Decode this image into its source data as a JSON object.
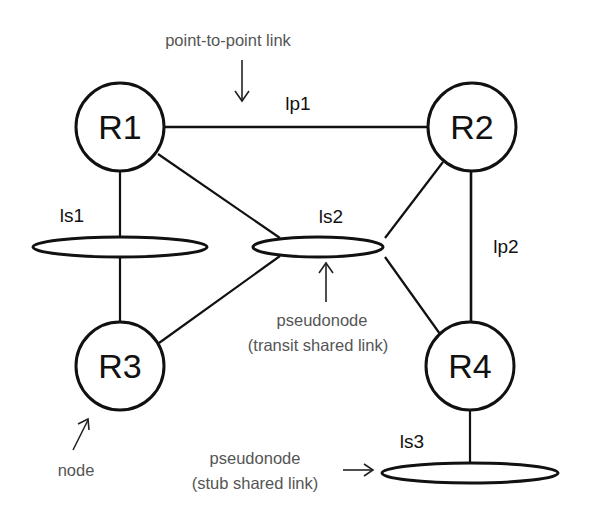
{
  "diagram": {
    "nodes": [
      {
        "id": "R1",
        "label": "R1"
      },
      {
        "id": "R2",
        "label": "R2"
      },
      {
        "id": "R3",
        "label": "R3"
      },
      {
        "id": "R4",
        "label": "R4"
      }
    ],
    "links": {
      "lp1": "lp1",
      "lp2": "lp2",
      "ls1": "ls1",
      "ls2": "ls2",
      "ls3": "ls3"
    },
    "annotations": {
      "point_to_point": "point-to-point link",
      "transit_line1": "pseudonode",
      "transit_line2": "(transit shared link)",
      "stub_line1": "pseudonode",
      "stub_line2": "(stub shared link)",
      "node": "node"
    },
    "colors": {
      "stroke": "#111111",
      "annotation_text": "#555555",
      "background": "#ffffff"
    }
  }
}
